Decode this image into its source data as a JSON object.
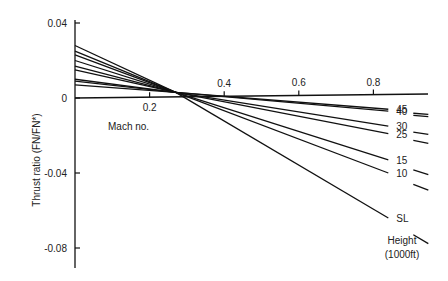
{
  "chart_data": {
    "type": "line",
    "title": "",
    "xlabel": "Mach no.",
    "ylabel": "Thrust ratio (FN/FN*)",
    "legend_title": "Height (1000ft)",
    "legend_title_lines": [
      "Height",
      "(1000ft)"
    ],
    "xlim": [
      0,
      0.85
    ],
    "ylim": [
      -0.09,
      0.04
    ],
    "x_ticks": [
      0.2,
      0.4,
      0.6,
      0.8
    ],
    "x_tick_labels": [
      "0.2",
      "0.4",
      "0.6",
      "0.8"
    ],
    "y_ticks": [
      0.04,
      0,
      -0.04,
      -0.08
    ],
    "y_tick_labels": [
      "0.04",
      "0",
      "-0.04",
      "-0.08"
    ],
    "grid": false,
    "legend_position": "right (inline labels)",
    "series": [
      {
        "name": "45",
        "x": [
          0,
          0.84
        ],
        "values": [
          0.007,
          -0.006
        ]
      },
      {
        "name": "40",
        "x": [
          0,
          0.84
        ],
        "values": [
          0.009,
          -0.007
        ]
      },
      {
        "name": "30",
        "x": [
          0,
          0.84
        ],
        "values": [
          0.01,
          -0.015
        ]
      },
      {
        "name": "25",
        "x": [
          0,
          0.84
        ],
        "values": [
          0.015,
          -0.019
        ]
      },
      {
        "name": "15",
        "x": [
          0,
          0.84
        ],
        "values": [
          0.017,
          -0.033
        ]
      },
      {
        "name": "10",
        "x": [
          0,
          0.84
        ],
        "values": [
          0.02,
          -0.04
        ]
      },
      {
        "name": "SL",
        "x": [
          0,
          0.84
        ],
        "values": [
          0.028,
          -0.064
        ]
      }
    ],
    "extra_lines_near_origin": [
      0.023,
      0.025
    ],
    "crossover_mach": 0.27
  }
}
